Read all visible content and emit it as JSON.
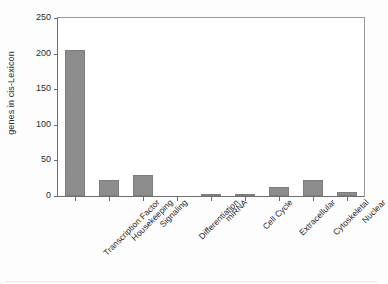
{
  "chart_data": {
    "type": "bar",
    "title": "",
    "subtitle": "",
    "xlabel": "",
    "ylabel": "genes in cis-Lexicon",
    "ylim": [
      0,
      250
    ],
    "yticks": [
      0,
      50,
      100,
      150,
      200,
      250
    ],
    "ytick_labels": [
      "0",
      "50",
      "100",
      "150",
      "200",
      "250"
    ],
    "grid": false,
    "legend": false,
    "legend_position": "none",
    "bar_color": "#8c8c8c",
    "bar_edge_color": "#7d7d7d",
    "axis_color": "#6e6e6e",
    "categories": [
      "Transcription Factor",
      "Housekeeping",
      "Signaling",
      "Differentiation",
      "miRNA",
      "Cell Cycle",
      "Extracellular",
      "Cytoskeletal",
      "Nuclear"
    ],
    "values": [
      205,
      22,
      29,
      0,
      2,
      2,
      13,
      22,
      6
    ]
  }
}
